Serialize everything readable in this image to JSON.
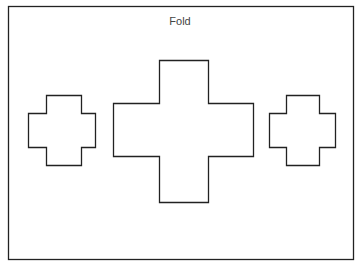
{
  "diagram": {
    "top_label": "Fold",
    "bottom_label": "",
    "stroke_color": "#222222",
    "background": "#ffffff",
    "frame": {
      "x": 8,
      "y": 6,
      "width": 345,
      "height": 253
    },
    "shapes": [
      {
        "name": "left-cross",
        "type": "cross",
        "x1": 28,
        "x2": 95,
        "y1": 95,
        "y2": 165,
        "arm_x1": 46,
        "arm_x2": 81,
        "arm_y1": 113,
        "arm_y2": 147
      },
      {
        "name": "center-cross",
        "type": "cross",
        "x1": 113,
        "x2": 253,
        "y1": 60,
        "y2": 202,
        "arm_x1": 159,
        "arm_x2": 208,
        "arm_y1": 103,
        "arm_y2": 156
      },
      {
        "name": "right-cross",
        "type": "cross",
        "x1": 269,
        "x2": 335,
        "y1": 95,
        "y2": 165,
        "arm_x1": 286,
        "arm_x2": 319,
        "arm_y1": 113,
        "arm_y2": 147
      }
    ]
  }
}
